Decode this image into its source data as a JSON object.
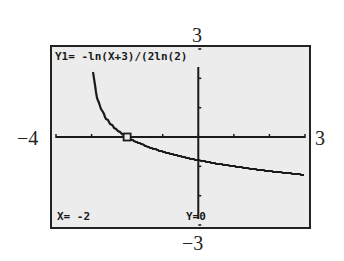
{
  "chart_data": {
    "type": "line",
    "title": "",
    "function_label": "Y1= -ln(X+3)/(2ln(2)",
    "expression": "y = -ln(x+3)/(2 ln 2)",
    "xlim": [
      -4,
      3
    ],
    "ylim": [
      -3,
      3
    ],
    "x_tick_step": 1,
    "y_tick_step": 1,
    "grid": false,
    "xlabel": "",
    "ylabel": "",
    "window_labels": {
      "xmin": "−4",
      "xmax": "3",
      "ymin": "−3",
      "ymax": "3"
    },
    "trace_point": {
      "x": -2,
      "y": 0
    },
    "trace_readout": {
      "x_text": "X= -2",
      "y_text": "Y=0"
    },
    "series": [
      {
        "name": "Y1",
        "x": [
          -2.9,
          -2.8,
          -2.6,
          -2.4,
          -2.2,
          -2.0,
          -1.5,
          -1.0,
          -0.5,
          0,
          0.5,
          1.0,
          1.5,
          2.0,
          2.5,
          3.0
        ],
        "values": [
          1.66,
          1.16,
          0.66,
          0.37,
          0.16,
          0.0,
          -0.29,
          -0.5,
          -0.66,
          -0.79,
          -0.9,
          -1.0,
          -1.08,
          -1.16,
          -1.23,
          -1.29
        ]
      }
    ]
  }
}
